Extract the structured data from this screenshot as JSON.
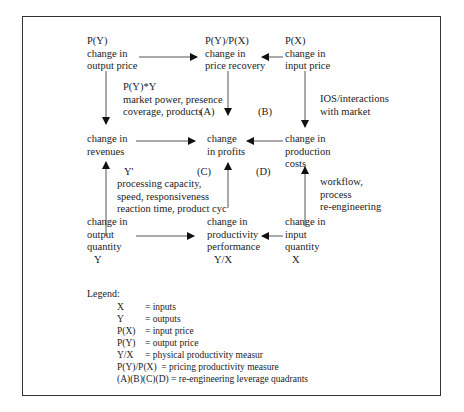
{
  "diagram": {
    "nodes": {
      "output_price": {
        "symbol": "P(Y)",
        "line1": "change in",
        "line2": "output price"
      },
      "price_recovery": {
        "symbol": "P(Y)/P(X)",
        "line1": "change in",
        "line2": "price recovery"
      },
      "input_price": {
        "symbol": "P(X)",
        "line1": "change in",
        "line2": "input price"
      },
      "revenues": {
        "line1": "change in",
        "line2": "revenues"
      },
      "profits": {
        "line1": "change",
        "line2": "in profits"
      },
      "production_costs": {
        "line1": "change in",
        "line2": "production",
        "line3": "costs"
      },
      "output_quantity": {
        "line1": "change in",
        "line2": "output",
        "line3": "quantity",
        "symbol": "Y"
      },
      "productivity": {
        "line1": "change in",
        "line2": "productivity",
        "line3": "performance",
        "symbol": "Y/X"
      },
      "input_quantity": {
        "line1": "change in",
        "line2": "input",
        "line3": "quantity",
        "symbol": "X"
      }
    },
    "annotations": {
      "quadrant_a": {
        "formula": "P(Y)*Y",
        "line1": "market power, presence",
        "line2": "coverage, products",
        "label": "(A)"
      },
      "quadrant_b": {
        "label": "(B)"
      },
      "ios": {
        "line1": "IOS/interactions",
        "line2": "with market"
      },
      "quadrant_c": {
        "formula": "Y'",
        "label": "(C)",
        "line1": "processing capacity,",
        "line2": "speed, responsiveness",
        "line3": "reaction time, product cyc"
      },
      "quadrant_d": {
        "label": "(D)"
      },
      "workflow": {
        "line1": "workflow,",
        "line2": "process",
        "line3": "re-engineering"
      }
    },
    "edges": [
      {
        "from": "output_price",
        "to": "price_recovery"
      },
      {
        "from": "input_price",
        "to": "price_recovery"
      },
      {
        "from": "output_price",
        "to": "revenues"
      },
      {
        "from": "price_recovery",
        "to": "profits"
      },
      {
        "from": "input_price",
        "to": "production_costs"
      },
      {
        "from": "revenues",
        "to": "profits"
      },
      {
        "from": "production_costs",
        "to": "profits"
      },
      {
        "from": "output_quantity",
        "to": "revenues"
      },
      {
        "from": "productivity",
        "to": "profits"
      },
      {
        "from": "input_quantity",
        "to": "production_costs"
      },
      {
        "from": "output_quantity",
        "to": "productivity"
      },
      {
        "from": "input_quantity",
        "to": "productivity"
      }
    ]
  },
  "legend": {
    "title": "Legend:",
    "items": [
      {
        "symbol": "X",
        "meaning": "= inputs"
      },
      {
        "symbol": "Y",
        "meaning": "= outputs"
      },
      {
        "symbol": "P(X)",
        "meaning": "= input price"
      },
      {
        "symbol": "P(Y)",
        "meaning": "= output price"
      },
      {
        "symbol": "Y/X",
        "meaning": "= physical productivity measur"
      },
      {
        "symbol": "P(Y)/P(X)",
        "meaning": "= pricing productivity measure"
      },
      {
        "symbol": "(A)(B)(C)(D)",
        "meaning": "= re-engineering leverage quadrants"
      }
    ]
  },
  "colors": {
    "line": "#333333",
    "text": "#222222",
    "background": "#ffffff"
  }
}
